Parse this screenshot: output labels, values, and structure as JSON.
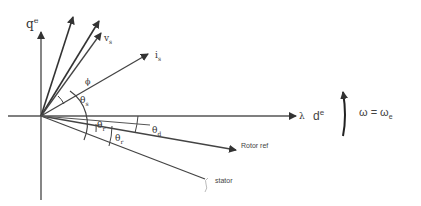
{
  "diagram": {
    "axes": {
      "q_axis_label": "q",
      "q_axis_sup": "e",
      "d_axis_prefix": "λ",
      "d_axis_label": "d",
      "d_axis_sup": "e"
    },
    "vectors": {
      "voltage_label": "v",
      "voltage_sub": "s",
      "current_label": "i",
      "current_sub": "s",
      "rotor_ref_label": "Rotor ref",
      "stator_label": "stator"
    },
    "angles": {
      "phi": "ϕ",
      "theta_s": "θ",
      "theta_s_sub": "s",
      "theta_r": "θ",
      "theta_r_sub": "r",
      "theta_sl": "θ",
      "theta_sl_sub": "r",
      "theta_d": "θ",
      "theta_d_sub": "d"
    },
    "rotation": {
      "equation": "ω = ω",
      "equation_sub": "e"
    },
    "colors": {
      "line": "#333333",
      "background": "#ffffff"
    }
  }
}
